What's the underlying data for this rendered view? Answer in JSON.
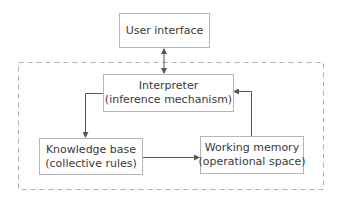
{
  "diagram": {
    "nodes": {
      "user_interface": {
        "lines": [
          "User interface"
        ]
      },
      "interpreter": {
        "lines": [
          "Interpreter",
          "(inference mechanism)"
        ]
      },
      "knowledge_base": {
        "lines": [
          "Knowledge base",
          "(collective rules)"
        ]
      },
      "working_memory": {
        "lines": [
          "Working memory",
          "(operational space)"
        ]
      }
    },
    "edges": [
      {
        "from": "user_interface",
        "to": "interpreter",
        "direction": "bidirectional"
      },
      {
        "from": "interpreter",
        "to": "knowledge_base",
        "direction": "forward"
      },
      {
        "from": "knowledge_base",
        "to": "working_memory",
        "direction": "forward"
      },
      {
        "from": "working_memory",
        "to": "interpreter",
        "direction": "forward"
      }
    ],
    "group": {
      "style": "dashed",
      "contains": [
        "interpreter",
        "knowledge_base",
        "working_memory"
      ]
    },
    "colors": {
      "line": "#555555",
      "box_border": "#b5b5b5",
      "dashed": "#b0b0b0",
      "text": "#3a3a3a"
    }
  }
}
